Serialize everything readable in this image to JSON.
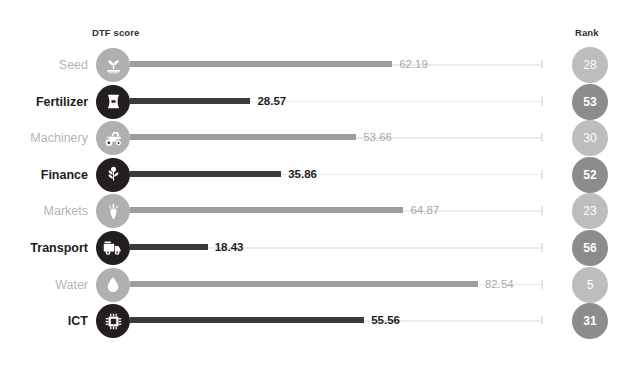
{
  "headers": {
    "score_label": "DTF score",
    "rank_label": "Rank"
  },
  "colors": {
    "dark_icon": "#231f20",
    "light_icon": "#b0b0b0",
    "dark_bar": "#3b3b3b",
    "light_bar": "#9d9d9d",
    "dark_badge": "#8c8c8c",
    "light_badge": "#bdbdbd",
    "track": "#ececec",
    "dark_text": "#1d1d1d",
    "light_text": "#b4b4b4",
    "background": "#ffffff"
  },
  "chart_data": {
    "type": "bar",
    "title": "",
    "xlabel": "DTF score",
    "ylabel": "",
    "xlim": [
      0,
      100
    ],
    "grid": false,
    "legend": "none",
    "orientation": "horizontal",
    "categories": [
      "Seed",
      "Fertilizer",
      "Machinery",
      "Finance",
      "Markets",
      "Transport",
      "Water",
      "ICT"
    ],
    "values": [
      62.19,
      28.57,
      53.66,
      35.86,
      64.87,
      18.43,
      82.54,
      55.56
    ],
    "ranks": [
      28,
      53,
      30,
      52,
      23,
      56,
      5,
      31
    ],
    "series": [
      {
        "name": "DTF score",
        "values": [
          62.19,
          28.57,
          53.66,
          35.86,
          64.87,
          18.43,
          82.54,
          55.56
        ]
      },
      {
        "name": "Rank",
        "values": [
          28,
          53,
          30,
          52,
          23,
          56,
          5,
          31
        ]
      }
    ]
  },
  "rows": [
    {
      "label": "Seed",
      "value": "62.19",
      "value_num": 62.19,
      "rank": "28",
      "icon": "seedling-icon",
      "emphasis": "light"
    },
    {
      "label": "Fertilizer",
      "value": "28.57",
      "value_num": 28.57,
      "rank": "53",
      "icon": "fertilizer-bag-icon",
      "emphasis": "dark"
    },
    {
      "label": "Machinery",
      "value": "53.66",
      "value_num": 53.66,
      "rank": "30",
      "icon": "tractor-icon",
      "emphasis": "light"
    },
    {
      "label": "Finance",
      "value": "35.86",
      "value_num": 35.86,
      "rank": "52",
      "icon": "plant-coin-icon",
      "emphasis": "dark"
    },
    {
      "label": "Markets",
      "value": "64.87",
      "value_num": 64.87,
      "rank": "23",
      "icon": "carrot-icon",
      "emphasis": "light"
    },
    {
      "label": "Transport",
      "value": "18.43",
      "value_num": 18.43,
      "rank": "56",
      "icon": "truck-icon",
      "emphasis": "dark"
    },
    {
      "label": "Water",
      "value": "82.54",
      "value_num": 82.54,
      "rank": "5",
      "icon": "water-drop-icon",
      "emphasis": "light"
    },
    {
      "label": "ICT",
      "value": "55.56",
      "value_num": 55.56,
      "rank": "31",
      "icon": "microchip-icon",
      "emphasis": "dark"
    }
  ]
}
